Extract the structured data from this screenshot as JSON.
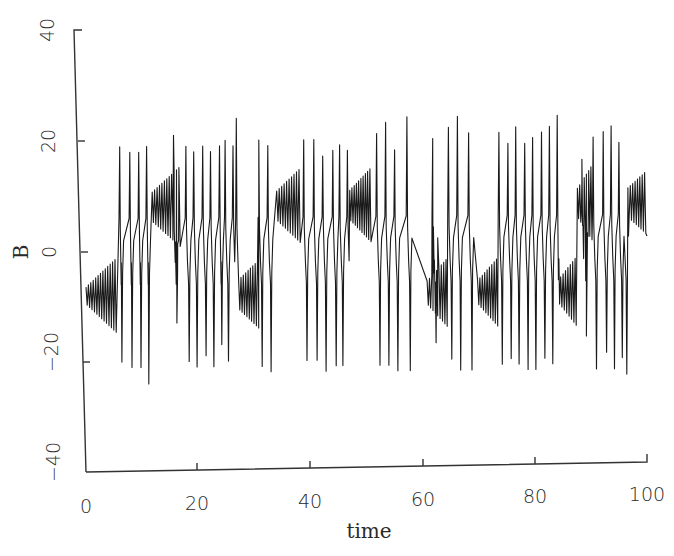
{
  "chart_data": {
    "type": "line",
    "title": "",
    "xlabel": "time",
    "ylabel": "B",
    "xlim": [
      0,
      100
    ],
    "ylim": [
      -40,
      40
    ],
    "xticks": [
      0,
      20,
      40,
      60,
      80,
      100
    ],
    "yticks": [
      -40,
      -20,
      0,
      20,
      40
    ],
    "xtick_labels": [
      "0",
      "20",
      "40",
      "60",
      "80",
      "100"
    ],
    "ytick_labels": [
      "−40",
      "−20",
      "0",
      "20",
      "40"
    ],
    "grid": false,
    "legend": null,
    "series": [
      {
        "name": "B",
        "color": "#1a1a1a",
        "description": "Chaotic Lorenz-like time series: growing oscillation bursts around B≈±8 with switching spikes to about ±20–24",
        "regimes": [
          {
            "t_start": 0.0,
            "t_end": 5.6,
            "center": -8,
            "amp_start": 3,
            "amp_end": 12
          },
          {
            "t_start": 5.6,
            "t_end": 11.8,
            "center": 0,
            "switching": true
          },
          {
            "t_start": 11.8,
            "t_end": 17.0,
            "center": 8,
            "amp_start": 5,
            "amp_end": 13
          },
          {
            "t_start": 17.0,
            "t_end": 27.2,
            "center": 0,
            "switching": true
          },
          {
            "t_start": 27.2,
            "t_end": 31.0,
            "center": -8,
            "amp_start": 5,
            "amp_end": 11
          },
          {
            "t_start": 31.0,
            "t_end": 34.0,
            "center": 0,
            "switching": true
          },
          {
            "t_start": 34.0,
            "t_end": 38.4,
            "center": 8,
            "amp_start": 5,
            "amp_end": 12
          },
          {
            "t_start": 38.4,
            "t_end": 47.0,
            "center": 0,
            "switching": true
          },
          {
            "t_start": 47.0,
            "t_end": 51.0,
            "center": 8,
            "amp_start": 5,
            "amp_end": 12
          },
          {
            "t_start": 51.0,
            "t_end": 60.8,
            "center": 0,
            "switching": true
          },
          {
            "t_start": 60.8,
            "t_end": 64.6,
            "center": -8,
            "amp_start": 4,
            "amp_end": 11
          },
          {
            "t_start": 64.6,
            "t_end": 69.8,
            "center": 0,
            "switching": true
          },
          {
            "t_start": 69.8,
            "t_end": 73.6,
            "center": -8,
            "amp_start": 4,
            "amp_end": 11
          },
          {
            "t_start": 73.6,
            "t_end": 84.2,
            "center": 0,
            "switching": true
          },
          {
            "t_start": 84.2,
            "t_end": 87.6,
            "center": -8,
            "amp_start": 4,
            "amp_end": 11
          },
          {
            "t_start": 87.6,
            "t_end": 90.4,
            "center": 8,
            "amp_start": 5,
            "amp_end": 12
          },
          {
            "t_start": 90.4,
            "t_end": 96.6,
            "center": 0,
            "switching": true
          },
          {
            "t_start": 96.6,
            "t_end": 100.0,
            "center": 8,
            "amp_start": 5,
            "amp_end": 10
          }
        ],
        "spike_peaks": [
          [
            6.0,
            19
          ],
          [
            6.4,
            -20
          ],
          [
            7.8,
            18
          ],
          [
            8.2,
            -21
          ],
          [
            9.4,
            18
          ],
          [
            9.8,
            -21
          ],
          [
            10.8,
            19
          ],
          [
            11.2,
            -24
          ],
          [
            15.6,
            21
          ],
          [
            16.2,
            -13
          ],
          [
            17.8,
            19
          ],
          [
            18.4,
            -20
          ],
          [
            19.2,
            18
          ],
          [
            19.8,
            -21
          ],
          [
            20.8,
            19
          ],
          [
            21.4,
            -19
          ],
          [
            22.2,
            18
          ],
          [
            22.8,
            -21
          ],
          [
            23.8,
            19
          ],
          [
            24.2,
            -17
          ],
          [
            24.8,
            20
          ],
          [
            25.4,
            -20
          ],
          [
            26.2,
            19
          ],
          [
            26.8,
            24
          ],
          [
            30.8,
            20
          ],
          [
            31.4,
            -21
          ],
          [
            32.4,
            19
          ],
          [
            33.0,
            -22
          ],
          [
            38.8,
            20
          ],
          [
            39.4,
            -20
          ],
          [
            40.6,
            20
          ],
          [
            41.2,
            -20
          ],
          [
            42.2,
            17
          ],
          [
            42.8,
            -22
          ],
          [
            44.0,
            18
          ],
          [
            44.6,
            -21
          ],
          [
            45.2,
            19
          ],
          [
            45.8,
            -21
          ],
          [
            46.6,
            18
          ],
          [
            51.8,
            21
          ],
          [
            52.4,
            -21
          ],
          [
            53.4,
            23
          ],
          [
            54.0,
            -21
          ],
          [
            55.0,
            18
          ],
          [
            55.6,
            -22
          ],
          [
            57.2,
            24
          ],
          [
            57.8,
            -22
          ],
          [
            61.8,
            20
          ],
          [
            62.4,
            -17
          ],
          [
            64.6,
            22
          ],
          [
            65.2,
            -20
          ],
          [
            66.2,
            24
          ],
          [
            66.8,
            -22
          ],
          [
            68.2,
            21
          ],
          [
            68.8,
            -22
          ],
          [
            73.6,
            21
          ],
          [
            74.2,
            -21
          ],
          [
            75.2,
            19
          ],
          [
            75.8,
            -20
          ],
          [
            76.6,
            22
          ],
          [
            77.2,
            -21
          ],
          [
            78.2,
            19
          ],
          [
            78.8,
            -22
          ],
          [
            79.6,
            20
          ],
          [
            80.2,
            -22
          ],
          [
            81.2,
            21
          ],
          [
            81.8,
            -20
          ],
          [
            82.6,
            22
          ],
          [
            83.2,
            -21
          ],
          [
            84.0,
            24
          ],
          [
            88.4,
            16
          ],
          [
            89.2,
            -16
          ],
          [
            90.4,
            20
          ],
          [
            91.0,
            -22
          ],
          [
            92.2,
            21
          ],
          [
            92.8,
            -19
          ],
          [
            93.6,
            22
          ],
          [
            94.2,
            -22
          ],
          [
            95.0,
            19
          ],
          [
            95.6,
            -20
          ],
          [
            96.4,
            -23
          ]
        ],
        "final_value": 2
      }
    ]
  },
  "axes": {
    "x_title": "time",
    "y_title": "B"
  }
}
